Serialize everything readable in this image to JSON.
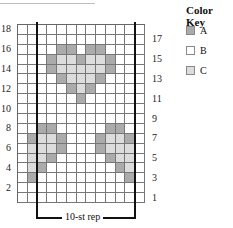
{
  "chart": {
    "columns": 13,
    "rows": 18,
    "repeat_label": "10-st rep",
    "left_row_numbers": [
      "18",
      "16",
      "14",
      "12",
      "10",
      "8",
      "6",
      "4",
      "2"
    ],
    "right_row_numbers": [
      "17",
      "15",
      "13",
      "11",
      "9",
      "7",
      "5",
      "3",
      "1"
    ],
    "pattern": {
      "16": {
        "A": [
          5,
          6,
          8,
          9
        ]
      },
      "15": {
        "A": [
          4,
          7,
          10
        ],
        "C": [
          5,
          6,
          8,
          9
        ]
      },
      "14": {
        "A": [
          4,
          10
        ],
        "C": [
          5,
          6,
          7,
          8,
          9
        ]
      },
      "13": {
        "A": [
          5,
          9
        ],
        "C": [
          6,
          7,
          8
        ]
      },
      "12": {
        "A": [
          6,
          8
        ],
        "C": [
          7
        ]
      },
      "11": {
        "A": [
          7
        ]
      },
      "8": {
        "A": [
          3,
          4,
          10,
          11
        ]
      },
      "7": {
        "A": [
          2,
          5,
          9,
          12
        ],
        "C": [
          3,
          4,
          10,
          11
        ]
      },
      "6": {
        "A": [
          5,
          9
        ],
        "C": [
          2,
          3,
          4,
          10,
          11,
          12
        ]
      },
      "5": {
        "A": [
          4,
          10
        ],
        "C": [
          2,
          3,
          11,
          12
        ]
      },
      "4": {
        "A": [
          3,
          11
        ],
        "C": [
          2,
          12
        ]
      },
      "3": {
        "A": [
          2,
          12
        ]
      }
    }
  },
  "color_key": {
    "title": "Color Key",
    "items": [
      {
        "label": "A",
        "color": "#ababab"
      },
      {
        "label": "B",
        "color": "#ffffff"
      },
      {
        "label": "C",
        "color": "#dcdcdc"
      }
    ]
  }
}
